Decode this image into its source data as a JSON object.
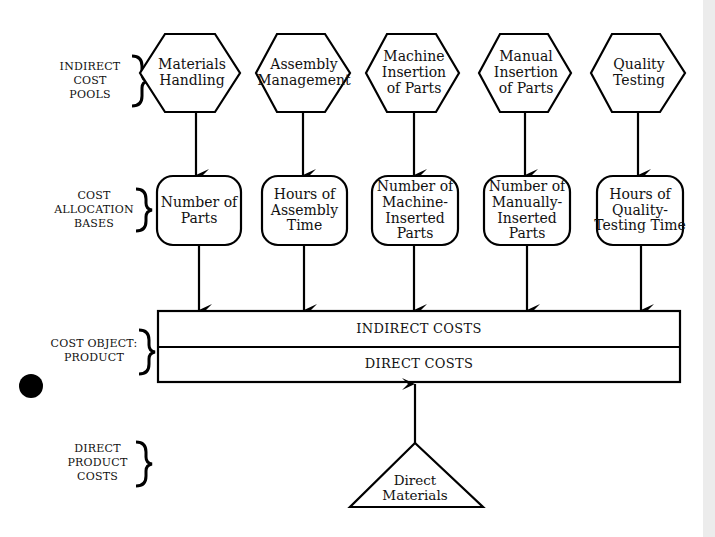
{
  "diagram": {
    "side_labels": {
      "indirect_cost_pools": "INDIRECT\nCOST\nPOOLS",
      "cost_allocation_bases": "COST\nALLOCATION\nBASES",
      "cost_object": "COST OBJECT:\nPRODUCT",
      "direct_product_costs": "DIRECT\nPRODUCT\nCOSTS"
    },
    "cost_pools": [
      {
        "label": "Materials\nHandling"
      },
      {
        "label": "Assembly\nManagement"
      },
      {
        "label": "Machine\nInsertion\nof Parts"
      },
      {
        "label": "Manual\nInsertion\nof Parts"
      },
      {
        "label": "Quality\nTesting"
      }
    ],
    "allocation_bases": [
      {
        "label": "Number of\nParts"
      },
      {
        "label": "Hours of\nAssembly\nTime"
      },
      {
        "label": "Number of\nMachine-\nInserted Parts"
      },
      {
        "label": "Number of\nManually-\nInserted Parts"
      },
      {
        "label": "Hours of\nQuality-\nTesting Time"
      }
    ],
    "cost_object": {
      "indirect_row": "INDIRECT COSTS",
      "direct_row": "DIRECT COSTS"
    },
    "direct_cost": {
      "label": "Direct\nMaterials"
    }
  }
}
